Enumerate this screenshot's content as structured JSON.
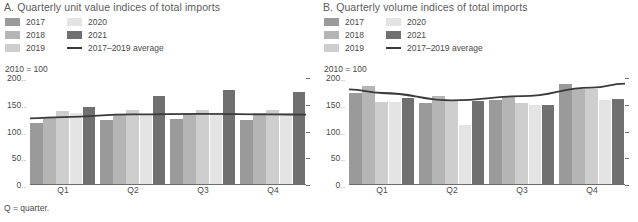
{
  "footnote": "Q = quarter.",
  "colors": {
    "y2017": "#9a9a9a",
    "y2018": "#b5b5b5",
    "y2019": "#cecece",
    "y2020": "#e4e4e4",
    "y2021": "#707070",
    "average_line": "#3a3a3a",
    "axis": "#6d6d6d",
    "text": "#4a4a4a"
  },
  "legend": {
    "column1": [
      {
        "label": "2017",
        "color_key": "y2017",
        "type": "swatch"
      },
      {
        "label": "2018",
        "color_key": "y2018",
        "type": "swatch"
      },
      {
        "label": "2019",
        "color_key": "y2019",
        "type": "swatch"
      }
    ],
    "column2": [
      {
        "label": "2020",
        "color_key": "y2020",
        "type": "swatch"
      },
      {
        "label": "2021",
        "color_key": "y2021",
        "type": "swatch"
      },
      {
        "label": "2017–2019 average",
        "color_key": "average_line",
        "type": "line"
      }
    ]
  },
  "panels": {
    "a": {
      "title": "A. Quarterly unit value indices of total imports",
      "axis_note": "2010 = 100"
    },
    "b": {
      "title": "B. Quarterly volume indices of total imports",
      "axis_note": "2010 = 100"
    }
  },
  "chart_data": [
    {
      "id": "panel-a",
      "type": "bar",
      "title": "A. Quarterly unit value indices of total imports",
      "subtitle": "2010 = 100",
      "xlabel": "",
      "ylabel": "2010 = 100",
      "categories": [
        "Q1",
        "Q2",
        "Q3",
        "Q4"
      ],
      "yticks": [
        0,
        50,
        100,
        150,
        200
      ],
      "ylim": [
        0,
        200
      ],
      "grid": false,
      "legend_position": "top-left",
      "series": [
        {
          "name": "2017",
          "values": [
            116,
            122,
            124,
            122
          ]
        },
        {
          "name": "2018",
          "values": [
            126,
            133,
            134,
            134
          ]
        },
        {
          "name": "2019",
          "values": [
            139,
            140,
            141,
            141
          ]
        },
        {
          "name": "2020",
          "values": [
            134,
            132,
            131,
            134
          ]
        },
        {
          "name": "2021",
          "values": [
            146,
            166,
            177,
            173
          ]
        }
      ],
      "overlay_line": {
        "name": "2017–2019 average",
        "values": [
          127,
          132,
          133,
          132
        ]
      }
    },
    {
      "id": "panel-b",
      "type": "bar",
      "title": "B. Quarterly volume indices of total imports",
      "subtitle": "2010 = 100",
      "xlabel": "",
      "ylabel": "2010 = 100",
      "categories": [
        "Q1",
        "Q2",
        "Q3",
        "Q4"
      ],
      "yticks": [
        0,
        50,
        100,
        150,
        200
      ],
      "ylim": [
        0,
        200
      ],
      "grid": false,
      "legend_position": "top-left",
      "series": [
        {
          "name": "2017",
          "values": [
            172,
            154,
            159,
            188
          ]
        },
        {
          "name": "2018",
          "values": [
            186,
            166,
            166,
            180
          ]
        },
        {
          "name": "2019",
          "values": [
            156,
            157,
            154,
            179
          ]
        },
        {
          "name": "2020",
          "values": [
            156,
            113,
            150,
            159
          ]
        },
        {
          "name": "2021",
          "values": [
            163,
            157,
            149,
            160
          ]
        }
      ],
      "overlay_line": {
        "name": "2017–2019 average",
        "values": [
          172,
          158,
          166,
          182
        ]
      }
    }
  ]
}
